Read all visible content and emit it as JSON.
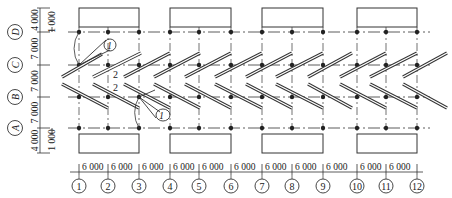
{
  "diagram": {
    "type": "structural-grid-plan",
    "stroke_color": "#333333",
    "axes_columns": {
      "labels": [
        "1",
        "2",
        "3",
        "4",
        "5",
        "6",
        "7",
        "8",
        "9",
        "10",
        "11",
        "12"
      ],
      "x": [
        79,
        108,
        139,
        170,
        199,
        231,
        262,
        292,
        323,
        357,
        386,
        417
      ],
      "spacings": [
        "6 000",
        "6 000",
        "6 000",
        "6 000",
        "6 000",
        "6 000",
        "6 000",
        "6 000",
        "6 000",
        "6 000",
        "6 000"
      ]
    },
    "axes_rows": {
      "labels": [
        "D",
        "C",
        "B",
        "A"
      ],
      "y": [
        32,
        65,
        97,
        128
      ]
    },
    "left_dimensions": {
      "outer": [
        "4 000",
        "7 000",
        "7 000",
        "7 000",
        "4 000"
      ],
      "inner_top": "1 000",
      "inner_bottom": "1 000"
    },
    "callouts": {
      "crane_top": "1",
      "crane_bottom": "1",
      "member_upper": "2",
      "member_lower": "2"
    }
  }
}
